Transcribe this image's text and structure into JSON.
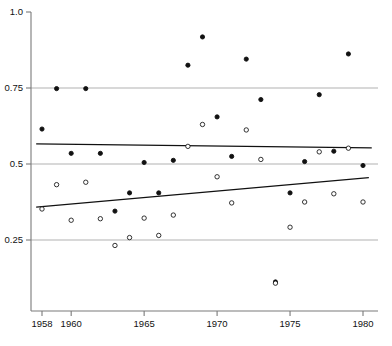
{
  "chart_data": {
    "type": "scatter",
    "title": "",
    "subtitle": "",
    "xlabel": "",
    "ylabel": "",
    "xlim": [
      1957.2,
      1980.8
    ],
    "ylim": [
      0.0,
      1.03
    ],
    "grid": true,
    "grid_axis": "y",
    "legend": "none",
    "x_ticks": [
      {
        "value": 1958,
        "label": "1958"
      },
      {
        "value": 1959,
        "label": ""
      },
      {
        "value": 1960,
        "label": "1960"
      },
      {
        "value": 1961,
        "label": ""
      },
      {
        "value": 1962,
        "label": ""
      },
      {
        "value": 1963,
        "label": ""
      },
      {
        "value": 1964,
        "label": ""
      },
      {
        "value": 1965,
        "label": "1965"
      },
      {
        "value": 1966,
        "label": ""
      },
      {
        "value": 1967,
        "label": ""
      },
      {
        "value": 1968,
        "label": ""
      },
      {
        "value": 1969,
        "label": ""
      },
      {
        "value": 1970,
        "label": "1970"
      },
      {
        "value": 1971,
        "label": ""
      },
      {
        "value": 1972,
        "label": ""
      },
      {
        "value": 1973,
        "label": ""
      },
      {
        "value": 1974,
        "label": ""
      },
      {
        "value": 1975,
        "label": "1975"
      },
      {
        "value": 1976,
        "label": ""
      },
      {
        "value": 1977,
        "label": ""
      },
      {
        "value": 1978,
        "label": ""
      },
      {
        "value": 1979,
        "label": ""
      },
      {
        "value": 1980,
        "label": "1980"
      }
    ],
    "y_ticks": [
      {
        "value": 0.25,
        "label": "0.25",
        "gridline": true
      },
      {
        "value": 0.5,
        "label": "0.5",
        "gridline": true
      },
      {
        "value": 0.75,
        "label": "0.75",
        "gridline": true
      },
      {
        "value": 1.0,
        "label": "1.0",
        "gridline": false
      }
    ],
    "series": [
      {
        "name": "filled-series",
        "marker": "filled-circle",
        "color": "#111111",
        "points": [
          {
            "x": 1958,
            "y": 0.615
          },
          {
            "x": 1959,
            "y": 0.748
          },
          {
            "x": 1960,
            "y": 0.535
          },
          {
            "x": 1961,
            "y": 0.748
          },
          {
            "x": 1962,
            "y": 0.535
          },
          {
            "x": 1963,
            "y": 0.345
          },
          {
            "x": 1964,
            "y": 0.405
          },
          {
            "x": 1965,
            "y": 0.505
          },
          {
            "x": 1966,
            "y": 0.405
          },
          {
            "x": 1967,
            "y": 0.512
          },
          {
            "x": 1968,
            "y": 0.825
          },
          {
            "x": 1969,
            "y": 0.918
          },
          {
            "x": 1970,
            "y": 0.655
          },
          {
            "x": 1971,
            "y": 0.525
          },
          {
            "x": 1972,
            "y": 0.845
          },
          {
            "x": 1973,
            "y": 0.712
          },
          {
            "x": 1974,
            "y": 0.112
          },
          {
            "x": 1975,
            "y": 0.405
          },
          {
            "x": 1976,
            "y": 0.508
          },
          {
            "x": 1977,
            "y": 0.728
          },
          {
            "x": 1978,
            "y": 0.542
          },
          {
            "x": 1980,
            "y": 0.495
          },
          {
            "x": 1979,
            "y": 0.862
          }
        ]
      },
      {
        "name": "open-series",
        "marker": "open-circle",
        "color": "#111111",
        "points": [
          {
            "x": 1958,
            "y": 0.352
          },
          {
            "x": 1959,
            "y": 0.432
          },
          {
            "x": 1960,
            "y": 0.315
          },
          {
            "x": 1961,
            "y": 0.44
          },
          {
            "x": 1962,
            "y": 0.32
          },
          {
            "x": 1963,
            "y": 0.232
          },
          {
            "x": 1964,
            "y": 0.258
          },
          {
            "x": 1965,
            "y": 0.322
          },
          {
            "x": 1966,
            "y": 0.265
          },
          {
            "x": 1967,
            "y": 0.332
          },
          {
            "x": 1968,
            "y": 0.558
          },
          {
            "x": 1969,
            "y": 0.63
          },
          {
            "x": 1970,
            "y": 0.458
          },
          {
            "x": 1971,
            "y": 0.372
          },
          {
            "x": 1972,
            "y": 0.612
          },
          {
            "x": 1973,
            "y": 0.515
          },
          {
            "x": 1974,
            "y": 0.108
          },
          {
            "x": 1975,
            "y": 0.292
          },
          {
            "x": 1976,
            "y": 0.375
          },
          {
            "x": 1977,
            "y": 0.54
          },
          {
            "x": 1978,
            "y": 0.402
          },
          {
            "x": 1979,
            "y": 0.552
          },
          {
            "x": 1980,
            "y": 0.375
          }
        ]
      }
    ],
    "trend_lines": [
      {
        "name": "upper-trend-line",
        "description": "near-flat regression line for filled series",
        "x0": 1957.6,
        "y0": 0.566,
        "x1": 1980.6,
        "y1": 0.553,
        "color": "#111111"
      },
      {
        "name": "lower-trend-line",
        "description": "rising regression line for open series",
        "x0": 1957.6,
        "y0": 0.358,
        "x1": 1980.4,
        "y1": 0.455,
        "color": "#111111"
      }
    ],
    "axis_color": "#7a7a7a",
    "gridline_color": "#a8a8a8",
    "background": "#ffffff"
  }
}
